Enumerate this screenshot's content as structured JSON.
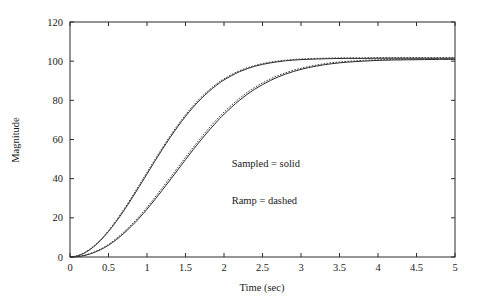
{
  "chart_data": {
    "type": "line",
    "title": "",
    "xlabel": "Time (sec)",
    "ylabel": "Magnitude",
    "xlim": [
      0,
      5
    ],
    "ylim": [
      0,
      120
    ],
    "grid": false,
    "legend_position": "inside-center-right",
    "xticks": [
      0,
      0.5,
      1,
      1.5,
      2,
      2.5,
      3,
      3.5,
      4,
      4.5,
      5
    ],
    "xtick_labels": [
      "0",
      "0.5",
      "1",
      "1.5",
      "2",
      "2.5",
      "3",
      "3.5",
      "4",
      "4.5",
      "5"
    ],
    "yticks": [
      0,
      20,
      40,
      60,
      80,
      100,
      120
    ],
    "ytick_labels": [
      "0",
      "20",
      "40",
      "60",
      "80",
      "100",
      "120"
    ],
    "annotations": [
      {
        "text": "Sampled  =  solid",
        "x": 2.1,
        "y": 46
      },
      {
        "text": "Ramp  =  dashed",
        "x": 2.1,
        "y": 27
      }
    ],
    "x": [
      0,
      0.1,
      0.2,
      0.3,
      0.4,
      0.5,
      0.6,
      0.7,
      0.8,
      0.9,
      1.0,
      1.1,
      1.2,
      1.3,
      1.4,
      1.5,
      1.6,
      1.7,
      1.8,
      1.9,
      2.0,
      2.2,
      2.4,
      2.6,
      2.8,
      3.0,
      3.2,
      3.4,
      3.6,
      3.8,
      4.0,
      4.2,
      4.4,
      4.6,
      4.8,
      5.0
    ],
    "series": [
      {
        "name": "Sampled = solid (fast)",
        "style": "solid",
        "values": [
          0,
          0.6,
          2.3,
          5.0,
          8.6,
          13.0,
          18.1,
          23.7,
          29.7,
          36.0,
          42.4,
          48.8,
          55.0,
          61.0,
          66.6,
          71.8,
          76.5,
          80.7,
          84.4,
          87.6,
          90.4,
          94.6,
          97.4,
          99.1,
          100.2,
          100.8,
          101.1,
          101.3,
          101.4,
          101.4,
          101.5,
          101.5,
          101.5,
          101.5,
          101.5,
          101.5
        ]
      },
      {
        "name": "Ramp = dashed (fast)",
        "style": "dashed",
        "values": [
          0,
          0.7,
          2.5,
          5.3,
          9.0,
          13.5,
          18.7,
          24.4,
          30.5,
          36.8,
          43.2,
          49.6,
          55.8,
          61.8,
          67.4,
          72.6,
          77.3,
          81.5,
          85.1,
          88.3,
          91.0,
          95.1,
          97.8,
          99.5,
          100.5,
          101.1,
          101.4,
          101.6,
          101.7,
          101.7,
          101.8,
          101.8,
          101.8,
          101.8,
          101.8,
          101.8
        ]
      },
      {
        "name": "Sampled = solid (slow)",
        "style": "solid",
        "values": [
          0,
          0.2,
          0.9,
          2.1,
          3.8,
          6.0,
          8.8,
          12.1,
          15.8,
          19.9,
          24.4,
          29.2,
          34.2,
          39.3,
          44.5,
          49.7,
          54.8,
          59.7,
          64.4,
          68.8,
          72.9,
          80.0,
          85.7,
          90.1,
          93.4,
          95.8,
          97.5,
          98.7,
          99.5,
          100.0,
          100.4,
          100.6,
          100.7,
          100.8,
          100.9,
          100.9
        ]
      },
      {
        "name": "Ramp = dashed (slow)",
        "style": "dashed",
        "values": [
          0,
          0.2,
          1.0,
          2.3,
          4.1,
          6.4,
          9.4,
          12.8,
          16.6,
          20.8,
          25.4,
          30.3,
          35.4,
          40.5,
          45.7,
          50.9,
          56.0,
          60.9,
          65.6,
          70.0,
          74.0,
          81.0,
          86.6,
          90.9,
          94.1,
          96.4,
          98.0,
          99.2,
          99.9,
          100.4,
          100.7,
          100.9,
          101.0,
          101.1,
          101.1,
          101.2
        ]
      }
    ]
  },
  "axes": {
    "xlabel": "Time (sec)",
    "ylabel": "Magnitude"
  }
}
